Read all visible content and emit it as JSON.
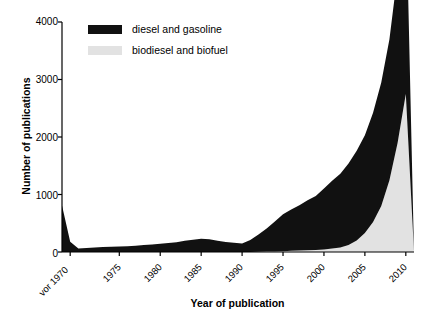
{
  "chart_data": {
    "type": "area",
    "title": "",
    "xlabel": "Year of publication",
    "ylabel": "Number of publications",
    "ylim": [
      0,
      4000
    ],
    "yticks": [
      0,
      1000,
      2000,
      3000,
      4000
    ],
    "xticks": [
      "vor 1970",
      "1975",
      "1980",
      "1985",
      "1990",
      "1995",
      "2000",
      "2005",
      "2010"
    ],
    "grid": false,
    "stacked": true,
    "legend_position": "top-left",
    "colors": {
      "diesel_and_gasoline": "#111111",
      "biodiesel_and_biofuel": "#e2e2e2",
      "axis": "#000000",
      "background": "#ffffff"
    },
    "x": [
      1968,
      1969,
      1970,
      1971,
      1972,
      1973,
      1974,
      1975,
      1976,
      1977,
      1978,
      1979,
      1980,
      1981,
      1982,
      1983,
      1984,
      1985,
      1986,
      1987,
      1988,
      1989,
      1990,
      1991,
      1992,
      1993,
      1994,
      1995,
      1996,
      1997,
      1998,
      1999,
      2000,
      2001,
      2002,
      2003,
      2004,
      2005,
      2006,
      2007,
      2008,
      2009,
      2010,
      2011
    ],
    "series": [
      {
        "name": "biodiesel and biofuel",
        "values": [
          0,
          0,
          0,
          0,
          0,
          0,
          0,
          0,
          0,
          0,
          0,
          0,
          0,
          0,
          0,
          0,
          0,
          0,
          0,
          0,
          0,
          0,
          0,
          0,
          5,
          8,
          10,
          15,
          20,
          25,
          30,
          35,
          45,
          60,
          80,
          120,
          200,
          330,
          520,
          800,
          1250,
          1900,
          2750,
          0
        ]
      },
      {
        "name": "diesel and gasoline",
        "values": [
          810,
          180,
          60,
          70,
          80,
          85,
          90,
          95,
          100,
          110,
          120,
          130,
          145,
          155,
          170,
          195,
          215,
          230,
          220,
          195,
          175,
          160,
          150,
          210,
          300,
          400,
          520,
          640,
          720,
          790,
          870,
          940,
          1060,
          1180,
          1280,
          1420,
          1560,
          1700,
          1900,
          2150,
          2450,
          2950,
          3500,
          0
        ]
      }
    ],
    "totals": [
      810,
      180,
      60,
      70,
      80,
      85,
      90,
      95,
      100,
      110,
      120,
      130,
      145,
      155,
      170,
      195,
      215,
      230,
      220,
      195,
      175,
      160,
      150,
      210,
      305,
      408,
      530,
      655,
      740,
      815,
      900,
      975,
      1105,
      1240,
      1360,
      1540,
      1760,
      2030,
      2420,
      2950,
      3700,
      4850,
      6250,
      0
    ]
  },
  "legend": {
    "items": [
      {
        "label": "diesel and gasoline",
        "color": "#111111"
      },
      {
        "label": "biodiesel and biofuel",
        "color": "#e2e2e2"
      }
    ]
  }
}
